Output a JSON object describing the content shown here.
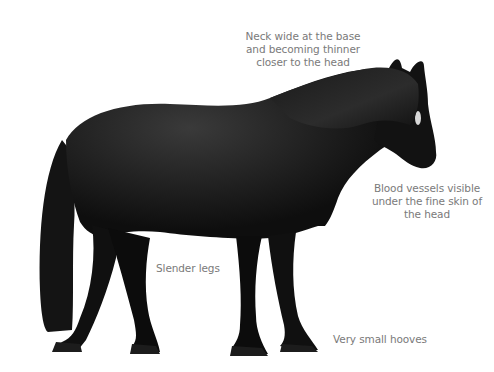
{
  "image": {
    "subject": "black pony standing in profile, facing right",
    "background_color": "#ffffff",
    "coat_color": "#0e0e0e",
    "highlight_color": "#3a3a3a",
    "label_color": "#7a7a7a"
  },
  "annotations": [
    {
      "id": "neck",
      "text": "Neck wide at the base\nand becoming thinner\ncloser to the head"
    },
    {
      "id": "blood",
      "text": "Blood vessels visible\nunder the fine skin of\nthe head"
    },
    {
      "id": "legs",
      "text": "Slender legs"
    },
    {
      "id": "hooves",
      "text": "Very small hooves"
    }
  ]
}
